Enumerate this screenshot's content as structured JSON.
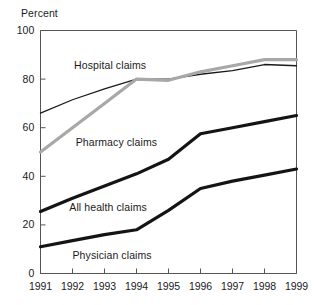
{
  "chart_data": {
    "type": "line",
    "title": "",
    "subtitle": "",
    "xlabel": "",
    "ylabel": "Percent",
    "ylim": [
      0,
      100
    ],
    "yticks": [
      0,
      20,
      40,
      60,
      80,
      100
    ],
    "x": [
      1991,
      1992,
      1993,
      1994,
      1995,
      1996,
      1997,
      1998,
      1999
    ],
    "xticks": [
      "1991",
      "1992",
      "1993",
      "1994",
      "1995",
      "1996",
      "1997",
      "1998",
      "1999"
    ],
    "grid": false,
    "legend_position": "inline-annotations",
    "series": [
      {
        "name": "Hospital claims",
        "color": "#1a1a1a",
        "width": 1.3,
        "values": [
          66,
          71.5,
          76,
          80,
          80,
          82,
          83.5,
          86,
          85.5
        ]
      },
      {
        "name": "Pharmacy claims",
        "color": "#a8a8a8",
        "width": 3.2,
        "values": [
          50,
          60,
          70,
          80,
          79.5,
          83,
          85.5,
          88,
          88
        ]
      },
      {
        "name": "All health claims",
        "color": "#141414",
        "width": 3.2,
        "values": [
          25.5,
          31,
          36,
          41,
          47,
          57.5,
          60,
          62.5,
          65
        ]
      },
      {
        "name": "Physician claims",
        "color": "#141414",
        "width": 3.2,
        "values": [
          11,
          13.5,
          16,
          18,
          26,
          35,
          38,
          40.5,
          43
        ]
      }
    ],
    "annotations": [
      {
        "text": "Hospital claims",
        "x": 1992.05,
        "y": 86
      },
      {
        "text": "Pharmacy claims",
        "x": 1992.1,
        "y": 54
      },
      {
        "text": "All health claims",
        "x": 1991.9,
        "y": 27.5
      },
      {
        "text": "Physician claims",
        "x": 1992.0,
        "y": 7.5
      }
    ]
  },
  "axis": {
    "unit_label": "Percent",
    "y_tick_labels": [
      "100",
      "80",
      "60",
      "40",
      "20",
      "0"
    ],
    "x_tick_labels": [
      "1991",
      "1992",
      "1993",
      "1994",
      "1995",
      "1996",
      "1997",
      "1998",
      "1999"
    ]
  },
  "colors": {
    "axis": "#555555",
    "text": "#1a1a1a",
    "pharmacy_gray": "#a8a8a8",
    "black_line": "#141414"
  }
}
